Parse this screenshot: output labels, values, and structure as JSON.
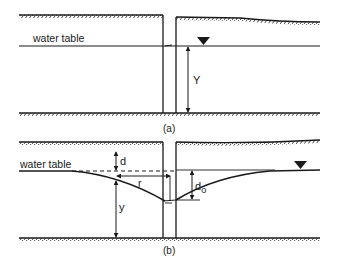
{
  "figure": {
    "panel_a": {
      "water_table_label": "water table",
      "height_label": "Y",
      "caption": "(a)"
    },
    "panel_b": {
      "water_table_label": "water table",
      "drawdown_label": "d",
      "radius_label": "r",
      "height_label": "y",
      "well_drawdown_label": "d",
      "well_drawdown_subscript": "o",
      "caption": "(b)"
    },
    "colors": {
      "ink": "#1a1a1a",
      "background": "#ffffff"
    }
  }
}
